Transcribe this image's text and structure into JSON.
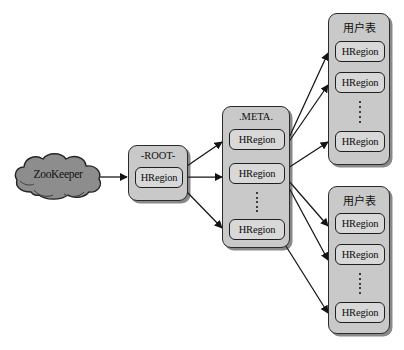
{
  "diagram": {
    "colors": {
      "container_fill": "#c9c9c9",
      "region_fill": "#d8d8d8",
      "cloud_fill": "#8d8d8d",
      "stroke": "#1f1f1f",
      "background": "#ffffff"
    }
  },
  "zookeeper": {
    "label": "ZooKeeper",
    "shape": "cloud"
  },
  "root_table": {
    "caption": "-ROOT-",
    "regions": [
      {
        "label": "HRegion"
      }
    ]
  },
  "meta_table": {
    "caption": ".META.",
    "regions": [
      {
        "label": "HRegion"
      },
      {
        "label": "HRegion"
      },
      {
        "label": "HRegion"
      }
    ],
    "ellipsis": "vertical-dots"
  },
  "user_tables": [
    {
      "caption": "用户表",
      "regions": [
        {
          "label": "HRegion"
        },
        {
          "label": "HRegion"
        },
        {
          "label": "HRegion"
        }
      ],
      "ellipsis": "vertical-dots"
    },
    {
      "caption": "用户表",
      "regions": [
        {
          "label": "HRegion"
        },
        {
          "label": "HRegion"
        },
        {
          "label": "HRegion"
        }
      ],
      "ellipsis": "vertical-dots"
    }
  ],
  "edges": [
    {
      "from": "zookeeper",
      "to": "root_table.regions.0",
      "arrow": true
    },
    {
      "from": "root_table.regions.0",
      "to": "meta_table.regions.0",
      "arrow": true
    },
    {
      "from": "root_table.regions.0",
      "to": "meta_table.regions.1",
      "arrow": true
    },
    {
      "from": "root_table.regions.0",
      "to": "meta_table.regions.2",
      "arrow": true
    },
    {
      "from": "meta_table.regions.0",
      "to": "user_tables.0.regions.0",
      "arrow": true
    },
    {
      "from": "meta_table.regions.0",
      "to": "user_tables.0.regions.1",
      "arrow": true
    },
    {
      "from": "meta_table.regions.1",
      "to": "user_tables.0.regions.2",
      "arrow": true
    },
    {
      "from": "meta_table.regions.1",
      "to": "user_tables.1.regions.0",
      "arrow": true
    },
    {
      "from": "meta_table.regions.1",
      "to": "user_tables.1.regions.1",
      "arrow": true
    },
    {
      "from": "meta_table.regions.2",
      "to": "user_tables.1.regions.2",
      "arrow": true
    }
  ]
}
